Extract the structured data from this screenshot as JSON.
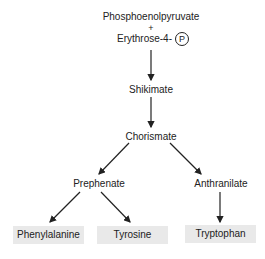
{
  "diagram": {
    "nodes": {
      "pep": "Phosphoenolpyruvate",
      "plus": "+",
      "e4p": "Erythrose-4-",
      "phosphate_symbol": "P",
      "shikimate": "Shikimate",
      "chorismate": "Chorismate",
      "prephenate": "Prephenate",
      "anthranilate": "Anthranilate",
      "phenylalanine": "Phenylalanine",
      "tyrosine": "Tyrosine",
      "tryptophan": "Tryptophan"
    },
    "edges": [
      {
        "from": "Phosphoenolpyruvate + Erythrose-4-P",
        "to": "Shikimate"
      },
      {
        "from": "Shikimate",
        "to": "Chorismate"
      },
      {
        "from": "Chorismate",
        "to": "Prephenate"
      },
      {
        "from": "Chorismate",
        "to": "Anthranilate"
      },
      {
        "from": "Prephenate",
        "to": "Phenylalanine"
      },
      {
        "from": "Prephenate",
        "to": "Tyrosine"
      },
      {
        "from": "Anthranilate",
        "to": "Tryptophan"
      }
    ],
    "colors": {
      "text": "#222222",
      "product_box": "#e9e9e9",
      "arrow": "#222222"
    }
  }
}
